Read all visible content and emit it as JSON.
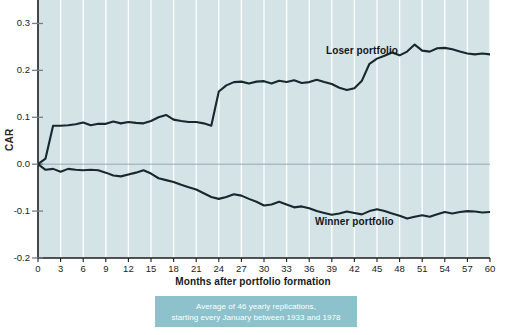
{
  "chart_data": {
    "type": "line",
    "title": "",
    "xlabel": "Months after portfolio formation",
    "ylabel": "CAR",
    "xlim": [
      0,
      60
    ],
    "ylim": [
      -0.2,
      0.35
    ],
    "yticks": [
      "0.3",
      "0.2",
      "0.1",
      "0.0",
      "-0.1",
      "-0.2"
    ],
    "ytick_values": [
      0.3,
      0.2,
      0.1,
      0.0,
      -0.1,
      -0.2
    ],
    "xticks": [
      "0",
      "3",
      "6",
      "9",
      "12",
      "15",
      "18",
      "21",
      "24",
      "27",
      "30",
      "33",
      "36",
      "39",
      "42",
      "45",
      "48",
      "51",
      "54",
      "57",
      "60"
    ],
    "xtick_values": [
      0,
      3,
      6,
      9,
      12,
      15,
      18,
      21,
      24,
      27,
      30,
      33,
      36,
      39,
      42,
      45,
      48,
      51,
      54,
      57,
      60
    ],
    "grid": "vertical-white-gridlines",
    "legend_position": "inline-annotations",
    "plot_background": "#d3e3e6",
    "line_color": "#17292c",
    "zero_line_color": "#8a9aa6",
    "x": [
      0,
      1,
      2,
      3,
      4,
      5,
      6,
      7,
      8,
      9,
      10,
      11,
      12,
      13,
      14,
      15,
      16,
      17,
      18,
      19,
      20,
      21,
      22,
      23,
      24,
      25,
      26,
      27,
      28,
      29,
      30,
      31,
      32,
      33,
      34,
      35,
      36,
      37,
      38,
      39,
      40,
      41,
      42,
      43,
      44,
      45,
      46,
      47,
      48,
      49,
      50,
      51,
      52,
      53,
      54,
      55,
      56,
      57,
      58,
      59,
      60
    ],
    "series": [
      {
        "name": "Loser portfolio",
        "label": "Loser portfolio",
        "values": [
          0.0,
          0.012,
          0.082,
          0.082,
          0.083,
          0.085,
          0.089,
          0.083,
          0.086,
          0.086,
          0.091,
          0.087,
          0.09,
          0.088,
          0.087,
          0.092,
          0.1,
          0.105,
          0.095,
          0.092,
          0.09,
          0.09,
          0.087,
          0.082,
          0.155,
          0.168,
          0.175,
          0.176,
          0.172,
          0.176,
          0.177,
          0.172,
          0.178,
          0.175,
          0.179,
          0.173,
          0.175,
          0.18,
          0.175,
          0.171,
          0.163,
          0.158,
          0.162,
          0.178,
          0.214,
          0.225,
          0.231,
          0.238,
          0.232,
          0.24,
          0.255,
          0.242,
          0.24,
          0.247,
          0.248,
          0.245,
          0.24,
          0.236,
          0.234,
          0.236,
          0.234
        ]
      },
      {
        "name": "Winner portfolio",
        "label": "Winner portfolio",
        "values": [
          0.0,
          -0.012,
          -0.01,
          -0.016,
          -0.01,
          -0.012,
          -0.013,
          -0.012,
          -0.013,
          -0.018,
          -0.024,
          -0.026,
          -0.022,
          -0.018,
          -0.013,
          -0.02,
          -0.03,
          -0.034,
          -0.038,
          -0.044,
          -0.049,
          -0.054,
          -0.062,
          -0.07,
          -0.074,
          -0.07,
          -0.064,
          -0.067,
          -0.074,
          -0.08,
          -0.088,
          -0.086,
          -0.08,
          -0.086,
          -0.092,
          -0.09,
          -0.094,
          -0.1,
          -0.104,
          -0.108,
          -0.105,
          -0.101,
          -0.104,
          -0.107,
          -0.1,
          -0.096,
          -0.1,
          -0.105,
          -0.11,
          -0.116,
          -0.112,
          -0.109,
          -0.112,
          -0.107,
          -0.102,
          -0.105,
          -0.102,
          -0.1,
          -0.101,
          -0.103,
          -0.102
        ]
      }
    ],
    "annotations": [
      {
        "text": "Loser portfolio",
        "x": 40,
        "y": 0.255
      },
      {
        "text": "Winner portfolio",
        "x": 38,
        "y": -0.135
      }
    ]
  },
  "caption": {
    "line1": "Average of 46 yearly replications,",
    "line2": "starting every January between 1933 and 1978",
    "background": "#8dc2cc",
    "text_color": "#ffffff"
  }
}
